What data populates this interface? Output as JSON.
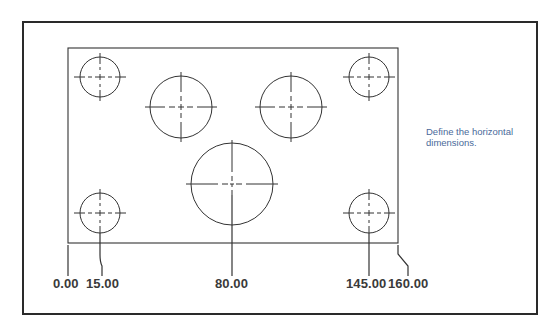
{
  "instruction": {
    "line1": "Define the horizontal",
    "line2": "dimensions."
  },
  "dimensions": {
    "labels": [
      "0.00",
      "15.00",
      "80.00",
      "145.00",
      "160.00"
    ],
    "unit_scale_px_per_unit": 2.0625
  },
  "part": {
    "outline": {
      "x": 68,
      "y": 48,
      "w": 330,
      "h": 195
    },
    "holes": [
      {
        "name": "top-left-small",
        "cx": 100,
        "cy": 77,
        "r": 20
      },
      {
        "name": "top-right-small",
        "cx": 369,
        "cy": 77,
        "r": 20
      },
      {
        "name": "bottom-left-small",
        "cx": 100,
        "cy": 213,
        "r": 20
      },
      {
        "name": "bottom-right-small",
        "cx": 369,
        "cy": 213,
        "r": 20
      },
      {
        "name": "upper-left-medium",
        "cx": 181,
        "cy": 107,
        "r": 31
      },
      {
        "name": "upper-right-medium",
        "cx": 291,
        "cy": 107,
        "r": 31
      },
      {
        "name": "center-large",
        "cx": 232,
        "cy": 184,
        "r": 41
      }
    ]
  },
  "colors": {
    "frame": "#2a2a2a",
    "line": "#333333",
    "label": "#3a3a3a",
    "instruction": "#4a6a9a"
  }
}
